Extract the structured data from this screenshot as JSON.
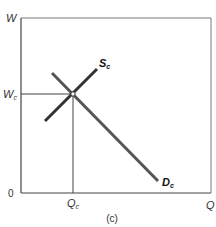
{
  "diagram": {
    "type": "supply-demand",
    "panel_label": "(c)",
    "axes": {
      "y_label": "W",
      "x_label": "Q",
      "origin_label": "0"
    },
    "equilibrium": {
      "wage_label_main": "W",
      "wage_label_sub": "c",
      "quantity_label_main": "Q",
      "quantity_label_sub": "c"
    },
    "curves": [
      {
        "id": "supply",
        "label_main": "S",
        "label_sub": "c",
        "slope": "upward",
        "color": "#333333"
      },
      {
        "id": "demand",
        "label_main": "D",
        "label_sub": "c",
        "slope": "downward",
        "color": "#555555"
      }
    ],
    "colors": {
      "axis": "#444444",
      "supply": "#333333",
      "demand": "#555555",
      "guide": "#444444"
    }
  }
}
